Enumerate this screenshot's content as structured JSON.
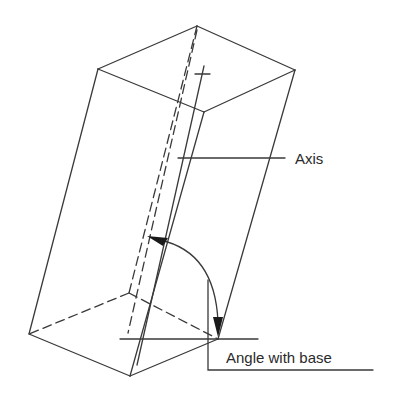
{
  "diagram": {
    "labels": {
      "axis": "Axis",
      "angle": "Angle with base"
    },
    "colors": {
      "line": "#3a3a3a",
      "text": "#2a2a2a",
      "background": "#ffffff"
    }
  }
}
